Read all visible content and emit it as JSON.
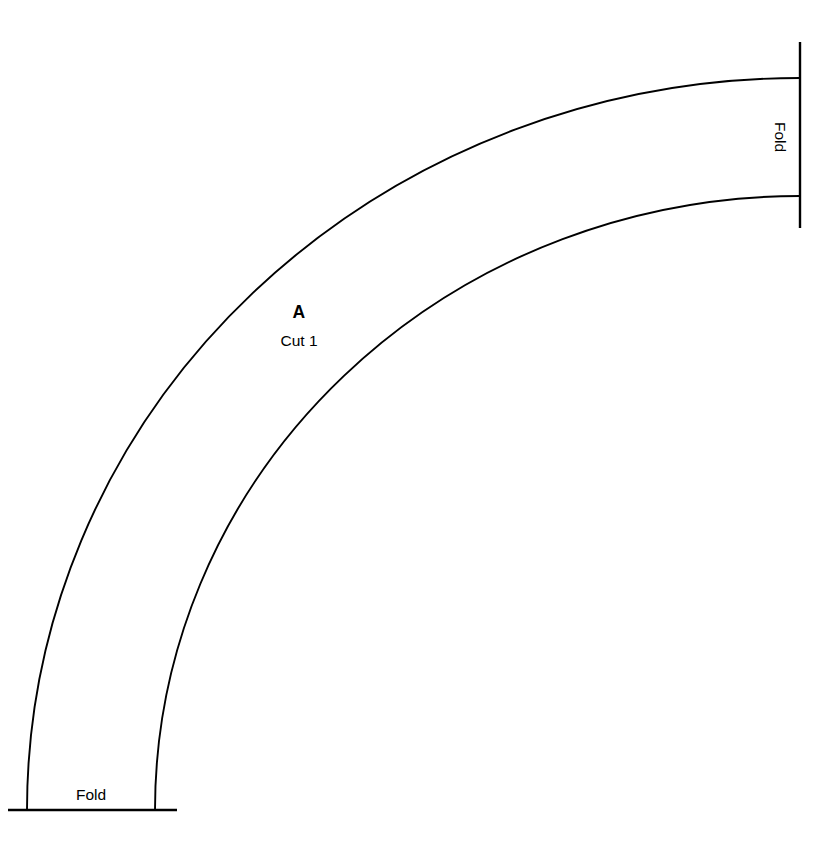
{
  "document": {
    "type": "sewing-pattern-piece",
    "background_color": "#ffffff",
    "line_color": "#000000",
    "width": 831,
    "height": 864
  },
  "piece": {
    "letter": "A",
    "cut_instruction": "Cut 1"
  },
  "fold_labels": {
    "bottom": "Fold",
    "right": "Fold"
  },
  "geometry": {
    "description": "Quarter-annulus pattern piece; concentric arcs sweeping from bottom-left fold edge to right fold edge",
    "arc_center": {
      "x": 800,
      "y": 810
    },
    "outer_arc": {
      "start": {
        "x": 27,
        "y": 810
      },
      "end": {
        "x": 800,
        "y": 78
      },
      "radius_x": 773,
      "radius_y": 732
    },
    "inner_arc": {
      "start": {
        "x": 155,
        "y": 810
      },
      "end": {
        "x": 800,
        "y": 196
      },
      "radius_x": 645,
      "radius_y": 614
    },
    "bottom_fold_edge": {
      "x1": 8,
      "y1": 810,
      "x2": 177,
      "y2": 810
    },
    "right_fold_edge": {
      "x1": 800,
      "y1": 42,
      "x2": 800,
      "y2": 228
    }
  }
}
